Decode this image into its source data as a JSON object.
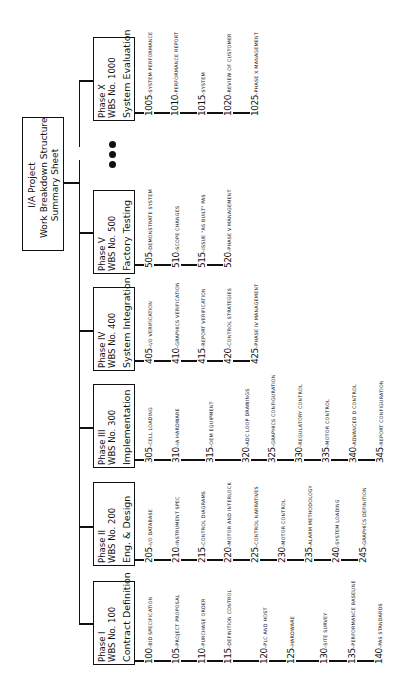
{
  "root": {
    "lines": [
      "I/A Project",
      "Work Breakdown Structure",
      "Summary Sheet"
    ]
  },
  "ellipsis_icon": "three-dots",
  "phases": [
    {
      "phase": "Phase I",
      "wbs": "WBS No. 100",
      "title": "Contract Definition",
      "items": [
        {
          "num": "100",
          "text": "BID SPECIFICATION"
        },
        {
          "num": "105",
          "text": "PROJECT PROPOSAL"
        },
        {
          "num": "110",
          "text": "PURCHASE ORDER"
        },
        {
          "num": "115",
          "text": "DEFINITION CONTROL"
        },
        {
          "num": "120",
          "text": "PLC AND HOST"
        },
        {
          "num": "125",
          "text": "HARDWARE"
        },
        {
          "num": "130",
          "text": "SITE SURVEY"
        },
        {
          "num": "135",
          "text": "PERFORMANCE BASELINE"
        },
        {
          "num": "140",
          "text": "PAS STANDARDS"
        }
      ]
    },
    {
      "phase": "Phase II",
      "wbs": "WBS No. 200",
      "title": "Eng. & Design",
      "items": [
        {
          "num": "205",
          "text": "I/O DATABASE"
        },
        {
          "num": "210",
          "text": "INSTRUMENT SPEC"
        },
        {
          "num": "215",
          "text": "CONTROL DIAGRAMS"
        },
        {
          "num": "220",
          "text": "MOTOR AND INTERLOCK"
        },
        {
          "num": "225",
          "text": "CONTROL NARRATIVES"
        },
        {
          "num": "230",
          "text": "MOTOR CONTROL"
        },
        {
          "num": "235",
          "text": "ALARM METHODOLOGY"
        },
        {
          "num": "240",
          "text": "SYSTEM LOADING"
        },
        {
          "num": "245",
          "text": "GRAPHICS DEFINITION"
        }
      ]
    },
    {
      "phase": "Phase III",
      "wbs": "WBS No. 300",
      "title": "Implementation",
      "items": [
        {
          "num": "305",
          "text": "CELL LOADING"
        },
        {
          "num": "310",
          "text": "IA HARDWARE"
        },
        {
          "num": "315",
          "text": "OEM EQUIPMENT"
        },
        {
          "num": "320",
          "text": "ADC LOOP DRAWINGS"
        },
        {
          "num": "325",
          "text": "GRAPHICS CONFIGURATION"
        },
        {
          "num": "330",
          "text": "REGULATORY CONTROL"
        },
        {
          "num": "335",
          "text": "MOTOR CONTROL"
        },
        {
          "num": "340",
          "text": "ADVANCED D CONTROL"
        },
        {
          "num": "345",
          "text": "REPORT CONFIGURATION"
        }
      ]
    },
    {
      "phase": "Phase IV",
      "wbs": "WBS No. 400",
      "title": "System Integration",
      "items": [
        {
          "num": "405",
          "text": "I/O VERIFICATION"
        },
        {
          "num": "410",
          "text": "GRAPHICS VERIFICATION"
        },
        {
          "num": "415",
          "text": "REPORT VERIFICATION"
        },
        {
          "num": "420",
          "text": "CONTROL STRATEGIES"
        },
        {
          "num": "425",
          "text": "PHASE IV MANAGEMENT"
        }
      ]
    },
    {
      "phase": "Phase V",
      "wbs": "WBS No. 500",
      "title": "Factory Testing",
      "items": [
        {
          "num": "505",
          "text": "DEMONSTRATE SYSTEM"
        },
        {
          "num": "510",
          "text": "SCOPE CHANGES"
        },
        {
          "num": "515",
          "text": "ISSUE \"AS BUILT\" PAS"
        },
        {
          "num": "520",
          "text": "PHASE V MANAGEMENT"
        }
      ]
    },
    {
      "phase": "Phase X",
      "wbs": "WBS No. 1000",
      "title": "System Evaluation",
      "items": [
        {
          "num": "1005",
          "text": "SYSTEM PERFORMANCE"
        },
        {
          "num": "1010",
          "text": "PERFORMANCE REPORT"
        },
        {
          "num": "1015",
          "text": "SYSTEM"
        },
        {
          "num": "1020",
          "text": "REVIEW OF CUSTOMER"
        },
        {
          "num": "1025",
          "text": "PHASE X MANAGEMENT"
        }
      ]
    }
  ]
}
